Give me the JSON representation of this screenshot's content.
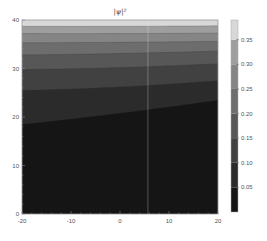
{
  "chart_data": {
    "type": "heatmap",
    "subtype": "contour",
    "title": "|ψ|²",
    "xlabel": "",
    "ylabel": "",
    "xlim": [
      -20,
      20
    ],
    "ylim": [
      0,
      40
    ],
    "x_ticks": [
      -20,
      -10,
      0,
      10,
      20
    ],
    "y_ticks": [
      0,
      10,
      20,
      30,
      40
    ],
    "grid": false,
    "colormap": "grayscale",
    "colorbar": {
      "position": "right",
      "range": [
        0.0,
        0.39
      ],
      "ticks": [
        0.05,
        0.1,
        0.15,
        0.2,
        0.25,
        0.3,
        0.35
      ],
      "tick_labels": [
        "0.05",
        "0.10",
        "0.15",
        "0.20",
        "0.25",
        "0.30",
        "0.35"
      ]
    },
    "contour_levels": [
      0.05,
      0.1,
      0.15,
      0.2,
      0.25,
      0.3,
      0.35
    ],
    "contour_boundaries": [
      {
        "level": 0.05,
        "y_at_x_minus20": 18.5,
        "y_at_x_0": 20.8,
        "y_at_x_20": 23.5
      },
      {
        "level": 0.1,
        "y_at_x_minus20": 25.5,
        "y_at_x_0": 26.2,
        "y_at_x_20": 27.5
      },
      {
        "level": 0.15,
        "y_at_x_minus20": 29.8,
        "y_at_x_0": 30.2,
        "y_at_x_20": 31.0
      },
      {
        "level": 0.2,
        "y_at_x_minus20": 32.8,
        "y_at_x_0": 33.1,
        "y_at_x_20": 33.6
      },
      {
        "level": 0.25,
        "y_at_x_minus20": 35.3,
        "y_at_x_0": 35.4,
        "y_at_x_20": 35.6
      },
      {
        "level": 0.3,
        "y_at_x_minus20": 37.2,
        "y_at_x_0": 37.2,
        "y_at_x_20": 37.3
      },
      {
        "level": 0.35,
        "y_at_x_minus20": 38.7,
        "y_at_x_0": 38.7,
        "y_at_x_20": 38.8
      }
    ],
    "band_colors": [
      "#151515",
      "#2b2b2b",
      "#414141",
      "#575757",
      "#6d6d6d",
      "#858585",
      "#9e9e9e",
      "#d8d8d8"
    ],
    "annotations": [
      {
        "type": "vertical_line",
        "x": 5.7,
        "color": "#e8e8e8"
      }
    ]
  }
}
